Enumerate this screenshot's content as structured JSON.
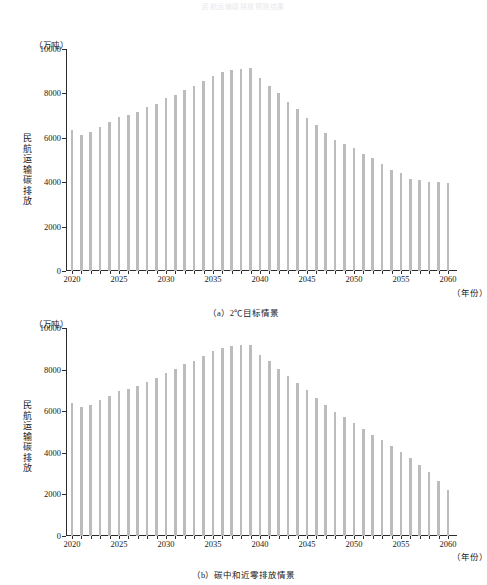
{
  "figure": {
    "title": "民航运输碳排放预测结果",
    "bar_color": "#bcbcbc",
    "axis_color": "#2b2b2b"
  },
  "panels": [
    {
      "key": "a",
      "caption": "（a）2℃目标情景",
      "unit_label": "（万吨）",
      "y_axis_title": "民航运输碳排放",
      "x_axis_unit": "（年份）",
      "y_ticks": [
        "0",
        "2000",
        "4000",
        "6000",
        "8000",
        "10000"
      ],
      "x_ticks": [
        "2020",
        "2025",
        "2030",
        "2035",
        "2040",
        "2045",
        "2050",
        "2055",
        "2060"
      ]
    },
    {
      "key": "b",
      "caption": "（b）碳中和近零排放情景",
      "unit_label": "（万吨）",
      "y_axis_title": "民航运输碳排放",
      "x_axis_unit": "（年份）",
      "y_ticks": [
        "0",
        "2000",
        "4000",
        "6000",
        "8000",
        "10000"
      ],
      "x_ticks": [
        "2020",
        "2025",
        "2030",
        "2035",
        "2040",
        "2045",
        "2050",
        "2055",
        "2060"
      ]
    }
  ],
  "chart_data": [
    {
      "type": "bar",
      "panel": "a",
      "title": "（a）2℃目标情景",
      "xlabel": "（年份）",
      "ylabel": "民航运输碳排放",
      "yunit": "（万吨）",
      "ylim": [
        0,
        10000
      ],
      "ytick_values": [
        0,
        2000,
        4000,
        6000,
        8000,
        10000
      ],
      "grid": false,
      "legend": "none",
      "categories": [
        2020,
        2021,
        2022,
        2023,
        2024,
        2025,
        2026,
        2027,
        2028,
        2029,
        2030,
        2031,
        2032,
        2033,
        2034,
        2035,
        2036,
        2037,
        2038,
        2039,
        2040,
        2041,
        2042,
        2043,
        2044,
        2045,
        2046,
        2047,
        2048,
        2049,
        2050,
        2051,
        2052,
        2053,
        2054,
        2055,
        2056,
        2057,
        2058,
        2059,
        2060
      ],
      "values": [
        6360,
        6130,
        6260,
        6500,
        6700,
        6950,
        7030,
        7160,
        7370,
        7510,
        7800,
        7950,
        8170,
        8330,
        8560,
        8800,
        8980,
        9050,
        9080,
        9150,
        8680,
        8350,
        8000,
        7620,
        7300,
        6900,
        6560,
        6230,
        5880,
        5700,
        5530,
        5280,
        5080,
        4800,
        4570,
        4430,
        4160,
        4090,
        4030,
        4000,
        3950
      ],
      "peak_year": 2039,
      "peak_value": 9150
    },
    {
      "type": "bar",
      "panel": "b",
      "title": "（b）碳中和近零排放情景",
      "xlabel": "（年份）",
      "ylabel": "民航运输碳排放",
      "yunit": "（万吨）",
      "ylim": [
        0,
        10000
      ],
      "ytick_values": [
        0,
        2000,
        4000,
        6000,
        8000,
        10000
      ],
      "grid": false,
      "legend": "none",
      "categories": [
        2020,
        2021,
        2022,
        2023,
        2024,
        2025,
        2026,
        2027,
        2028,
        2029,
        2030,
        2031,
        2032,
        2033,
        2034,
        2035,
        2036,
        2037,
        2038,
        2039,
        2040,
        2041,
        2042,
        2043,
        2044,
        2045,
        2046,
        2047,
        2048,
        2049,
        2050,
        2051,
        2052,
        2053,
        2054,
        2055,
        2056,
        2057,
        2058,
        2059,
        2060
      ],
      "values": [
        6400,
        6200,
        6300,
        6520,
        6730,
        6970,
        7080,
        7230,
        7420,
        7580,
        7850,
        8020,
        8250,
        8420,
        8650,
        8880,
        9050,
        9120,
        9180,
        9200,
        8700,
        8400,
        8050,
        7700,
        7350,
        7000,
        6650,
        6300,
        5980,
        5700,
        5420,
        5150,
        4850,
        4600,
        4350,
        4050,
        3750,
        3400,
        3080,
        2650,
        2200
      ],
      "peak_year": 2039,
      "peak_value": 9200
    }
  ]
}
